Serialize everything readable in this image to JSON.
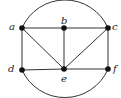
{
  "diagram": {
    "type": "undirected-graph",
    "stroke_color": "#333333",
    "vertex_color": "#111111",
    "vertices": [
      {
        "id": "a",
        "label": "a",
        "x": 22,
        "y": 28,
        "label_x": 9,
        "label_y": 22
      },
      {
        "id": "b",
        "label": "b",
        "x": 64,
        "y": 28,
        "label_x": 61,
        "label_y": 16
      },
      {
        "id": "c",
        "label": "c",
        "x": 108,
        "y": 28,
        "label_x": 112,
        "label_y": 22
      },
      {
        "id": "d",
        "label": "d",
        "x": 22,
        "y": 70,
        "label_x": 8,
        "label_y": 64
      },
      {
        "id": "e",
        "label": "e",
        "x": 64,
        "y": 69,
        "label_x": 61,
        "label_y": 74
      },
      {
        "id": "f",
        "label": "f",
        "x": 108,
        "y": 69,
        "label_x": 113,
        "label_y": 64
      }
    ],
    "edges": [
      [
        "a",
        "b"
      ],
      [
        "b",
        "c"
      ],
      [
        "a",
        "d"
      ],
      [
        "a",
        "e"
      ],
      [
        "b",
        "e"
      ],
      [
        "c",
        "e"
      ],
      [
        "c",
        "f"
      ],
      [
        "d",
        "e"
      ],
      [
        "e",
        "f"
      ]
    ],
    "arcs": [
      {
        "from": "a",
        "to": "c",
        "side": "top"
      },
      {
        "from": "d",
        "to": "f",
        "side": "bottom"
      }
    ]
  }
}
